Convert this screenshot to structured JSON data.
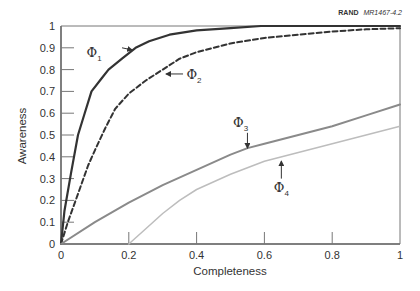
{
  "credit": {
    "org": "RAND",
    "report_id": "MR1467-4.2"
  },
  "chart_data": {
    "type": "line",
    "title": "",
    "xlabel": "Completeness",
    "ylabel": "Awareness",
    "xlim": [
      0,
      1
    ],
    "ylim": [
      0,
      1
    ],
    "grid": false,
    "legend": "inline annotations with arrows",
    "x_ticks": [
      "0",
      "0.2",
      "0.4",
      "0.6",
      "0.8",
      "1"
    ],
    "y_ticks": [
      "0",
      "0.1",
      "0.2",
      "0.3",
      "0.4",
      "0.5",
      "0.6",
      "0.7",
      "0.8",
      "0.9",
      "1"
    ],
    "series": [
      {
        "name": "Φ1",
        "label_main": "Φ",
        "label_sub": "1",
        "style": "solid",
        "color": "#333333",
        "width": 2.2,
        "x": [
          0,
          0.01,
          0.03,
          0.05,
          0.07,
          0.09,
          0.12,
          0.14,
          0.18,
          0.22,
          0.26,
          0.32,
          0.4,
          0.5,
          0.59,
          0.7,
          0.85,
          1.0
        ],
        "y": [
          0,
          0.15,
          0.33,
          0.5,
          0.6,
          0.7,
          0.76,
          0.8,
          0.85,
          0.9,
          0.93,
          0.96,
          0.98,
          0.99,
          1.0,
          1.0,
          1.0,
          1.0
        ]
      },
      {
        "name": "Φ2",
        "label_main": "Φ",
        "label_sub": "2",
        "style": "dashed",
        "color": "#333333",
        "width": 2.0,
        "x": [
          0,
          0.02,
          0.05,
          0.08,
          0.1,
          0.13,
          0.16,
          0.2,
          0.25,
          0.3,
          0.35,
          0.4,
          0.5,
          0.6,
          0.7,
          0.8,
          0.9,
          1.0
        ],
        "y": [
          0,
          0.1,
          0.23,
          0.36,
          0.43,
          0.53,
          0.62,
          0.69,
          0.75,
          0.8,
          0.85,
          0.88,
          0.92,
          0.945,
          0.96,
          0.975,
          0.985,
          0.99
        ]
      },
      {
        "name": "Φ3",
        "label_main": "Φ",
        "label_sub": "3",
        "style": "solid",
        "color": "#8a8a8a",
        "width": 2.0,
        "x": [
          0,
          0.1,
          0.2,
          0.3,
          0.4,
          0.5,
          0.55,
          0.6,
          0.7,
          0.8,
          0.9,
          1.0
        ],
        "y": [
          0,
          0.1,
          0.19,
          0.27,
          0.34,
          0.41,
          0.44,
          0.46,
          0.5,
          0.54,
          0.59,
          0.64
        ]
      },
      {
        "name": "Φ4",
        "label_main": "Φ",
        "label_sub": "4",
        "style": "solid",
        "color": "#bdbdbd",
        "width": 1.5,
        "x": [
          0.2,
          0.25,
          0.3,
          0.35,
          0.4,
          0.5,
          0.6,
          0.7,
          0.8,
          0.9,
          1.0
        ],
        "y": [
          0,
          0.07,
          0.14,
          0.2,
          0.25,
          0.32,
          0.38,
          0.42,
          0.46,
          0.5,
          0.54
        ]
      }
    ],
    "annotations": [
      {
        "series": "Φ1",
        "label_x": 0.12,
        "label_y": 0.88,
        "arrow_from": [
          0.18,
          0.9
        ],
        "arrow_to": [
          0.21,
          0.89
        ],
        "direction": "right"
      },
      {
        "series": "Φ2",
        "label_x": 0.37,
        "label_y": 0.78,
        "arrow_from": [
          0.36,
          0.78
        ],
        "arrow_to": [
          0.31,
          0.78
        ],
        "direction": "left"
      },
      {
        "series": "Φ3",
        "label_x": 0.53,
        "label_y": 0.56,
        "arrow_from": [
          0.55,
          0.51
        ],
        "arrow_to": [
          0.55,
          0.44
        ],
        "direction": "down"
      },
      {
        "series": "Φ4",
        "label_x": 0.65,
        "label_y": 0.26,
        "arrow_from": [
          0.65,
          0.3
        ],
        "arrow_to": [
          0.65,
          0.38
        ],
        "direction": "up"
      }
    ]
  }
}
